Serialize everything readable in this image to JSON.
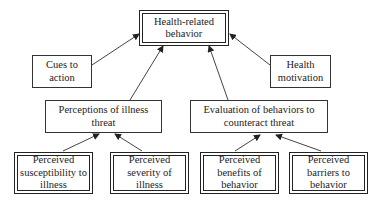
{
  "diagram": {
    "nodes": {
      "outcome": {
        "label": "Health-related behavior",
        "line1": "Health-related",
        "line2": "behavior"
      },
      "cues": {
        "label": "Cues to action",
        "line1": "Cues to",
        "line2": "action"
      },
      "motivation": {
        "label": "Health motivation",
        "line1": "Health",
        "line2": "motivation"
      },
      "threat": {
        "label": "Perceptions of illness threat",
        "line1": "Perceptions of illness",
        "line2": "threat"
      },
      "evaluation": {
        "label": "Evaluation of behaviors to counteract threat",
        "line1": "Evaluation of behaviors to",
        "line2": "counteract threat"
      },
      "susceptibility": {
        "label": "Perceived susceptibility to illness",
        "line1": "Perceived",
        "line2": "susceptibility to",
        "line3": "illness"
      },
      "severity": {
        "label": "Perceived severity of illness",
        "line1": "Perceived",
        "line2": "severity of",
        "line3": "illness"
      },
      "benefits": {
        "label": "Perceived benefits of behavior",
        "line1": "Perceived",
        "line2": "benefits of",
        "line3": "behavior"
      },
      "barriers": {
        "label": "Perceived barriers to behavior",
        "line1": "Perceived",
        "line2": "barriers to",
        "line3": "behavior"
      }
    },
    "edges": [
      {
        "from": "cues",
        "to": "outcome"
      },
      {
        "from": "motivation",
        "to": "outcome"
      },
      {
        "from": "threat",
        "to": "outcome"
      },
      {
        "from": "evaluation",
        "to": "outcome"
      },
      {
        "from": "susceptibility",
        "to": "threat"
      },
      {
        "from": "severity",
        "to": "threat"
      },
      {
        "from": "benefits",
        "to": "evaluation"
      },
      {
        "from": "barriers",
        "to": "evaluation"
      }
    ],
    "colors": {
      "line": "#333333",
      "border": "#222222",
      "background": "#ffffff"
    }
  }
}
